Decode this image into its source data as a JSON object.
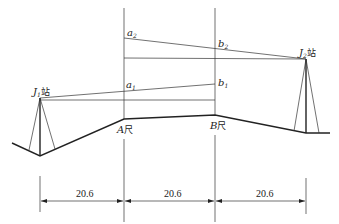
{
  "diagram": {
    "stations": [
      {
        "id": "J1",
        "label": "J",
        "subscript": "1",
        "suffix": "站"
      },
      {
        "id": "J2",
        "label": "J",
        "subscript": "2",
        "suffix": "站"
      }
    ],
    "staffs": [
      {
        "id": "A",
        "label": "A",
        "suffix": "尺"
      },
      {
        "id": "B",
        "label": "B",
        "suffix": "尺"
      }
    ],
    "readings": [
      {
        "id": "a2",
        "label": "a",
        "subscript": "2"
      },
      {
        "id": "b2",
        "label": "b",
        "subscript": "2"
      },
      {
        "id": "a1",
        "label": "a",
        "subscript": "1"
      },
      {
        "id": "b1",
        "label": "b",
        "subscript": "1"
      }
    ],
    "dimensions": [
      {
        "id": "d1",
        "value": "20.6"
      },
      {
        "id": "d2",
        "value": "20.6"
      },
      {
        "id": "d3",
        "value": "20.6"
      }
    ],
    "colors": {
      "line": "#222222",
      "background": "#ffffff"
    }
  }
}
